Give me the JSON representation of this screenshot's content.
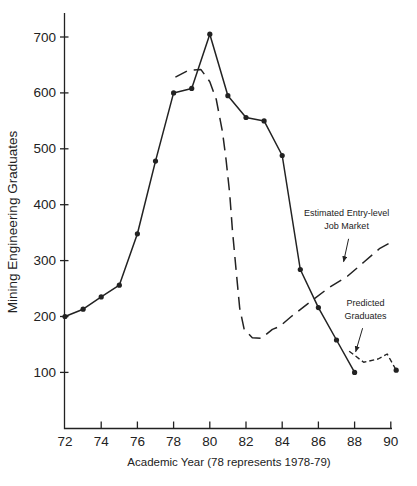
{
  "figure": {
    "background_color": "#ffffff",
    "ink_color": "#222222"
  },
  "chart_data": {
    "type": "line",
    "title": "",
    "xlabel": "Academic Year (78 represents 1978-79)",
    "ylabel": "Mining Engineering Graduates",
    "x_ticks": [
      72,
      74,
      76,
      78,
      80,
      82,
      84,
      86,
      88,
      90
    ],
    "y_ticks": [
      100,
      200,
      300,
      400,
      500,
      600,
      700
    ],
    "xlim": [
      72,
      90.6
    ],
    "ylim": [
      0,
      745
    ],
    "grid": false,
    "legend_position": "none (inline text annotations with arrows)",
    "series": [
      {
        "id": "actual-graduates",
        "name": "Mining Engineering Graduates (actual)",
        "style": "solid",
        "markers": "all",
        "x": [
          72,
          73,
          74,
          75,
          76,
          77,
          78,
          79,
          80,
          81,
          82,
          83,
          84,
          85,
          86,
          87,
          88
        ],
        "values": [
          200,
          213,
          235,
          256,
          348,
          478,
          600,
          608,
          705,
          595,
          556,
          550,
          488,
          284,
          216,
          158,
          100
        ]
      },
      {
        "id": "job-market",
        "name": "Estimated Entry-level Job Market",
        "style": "long-dash",
        "markers": "none",
        "points": [
          [
            78.1,
            628
          ],
          [
            78.8,
            640
          ],
          [
            79.5,
            642
          ],
          [
            80.0,
            620
          ],
          [
            80.36,
            588
          ],
          [
            80.7,
            530
          ],
          [
            80.9,
            480
          ],
          [
            81.1,
            420
          ],
          [
            81.25,
            355
          ],
          [
            81.45,
            285
          ],
          [
            81.65,
            215
          ],
          [
            81.9,
            177
          ],
          [
            82.35,
            162
          ],
          [
            82.85,
            161
          ],
          [
            83.46,
            177
          ],
          [
            83.85,
            182
          ],
          [
            84.5,
            200
          ],
          [
            85.7,
            230
          ],
          [
            86.6,
            252
          ],
          [
            87.6,
            272
          ],
          [
            88.5,
            297
          ],
          [
            89.4,
            322
          ],
          [
            89.9,
            331
          ]
        ]
      },
      {
        "id": "predicted-graduates",
        "name": "Predicted Graduates",
        "style": "short-dash",
        "markers": "end",
        "points": [
          [
            87.7,
            138
          ],
          [
            88.5,
            118
          ],
          [
            89.3,
            124
          ],
          [
            89.8,
            133
          ],
          [
            90.3,
            104
          ]
        ]
      }
    ],
    "annotations": [
      {
        "name": "job-market-label",
        "lines": [
          "Estimated Entry-level",
          "Job Market"
        ],
        "text_pos": [
          87.56,
          380
        ],
        "arrow_from": [
          87.67,
          339
        ],
        "arrow_to": [
          87.39,
          298
        ]
      },
      {
        "name": "predicted-graduates-label",
        "lines": [
          "Predicted",
          "Graduates"
        ],
        "text_pos": [
          88.6,
          218
        ],
        "arrow_from": [
          88.44,
          179
        ],
        "arrow_to": [
          88.06,
          137
        ]
      }
    ]
  }
}
